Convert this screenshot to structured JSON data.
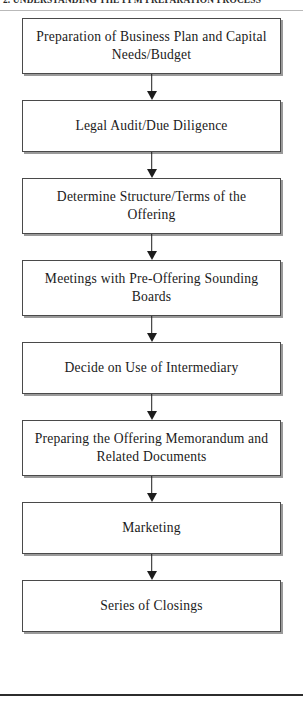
{
  "header": {
    "running_head": "2. UNDERSTANDING THE PPM PREPARATION PROCESS"
  },
  "chart_data": {
    "type": "diagram",
    "diagram_type": "flowchart",
    "orientation": "vertical",
    "title": "",
    "node_shape": "rectangle",
    "connector": "arrow-down",
    "node_count": 8,
    "nodes": [
      {
        "id": 1,
        "label": "Preparation of Business Plan and Capital Needs/Budget",
        "lines": 2
      },
      {
        "id": 2,
        "label": "Legal Audit/Due Diligence",
        "lines": 1
      },
      {
        "id": 3,
        "label": "Determine Structure/Terms of the Offering",
        "lines": 2
      },
      {
        "id": 4,
        "label": "Meetings with Pre-Offering Sounding Boards",
        "lines": 2
      },
      {
        "id": 5,
        "label": "Decide on Use of Intermediary",
        "lines": 1
      },
      {
        "id": 6,
        "label": "Preparing the Offering Memorandum and Related Documents",
        "lines": 2
      },
      {
        "id": 7,
        "label": "Marketing",
        "lines": 1
      },
      {
        "id": 8,
        "label": "Series of Closings",
        "lines": 1
      }
    ],
    "edges": [
      {
        "from": 1,
        "to": 2
      },
      {
        "from": 2,
        "to": 3
      },
      {
        "from": 3,
        "to": 4
      },
      {
        "from": 4,
        "to": 5
      },
      {
        "from": 5,
        "to": 6
      },
      {
        "from": 6,
        "to": 7
      },
      {
        "from": 7,
        "to": 8
      }
    ],
    "colors": {
      "node_border": "#4a4a4a",
      "node_fill": "#ffffff",
      "node_shadow": "#9a9a9a",
      "arrow": "#1d1d1d",
      "text": "#1a1a1a",
      "header_rule": "#b9b9b9",
      "footer_rule": "#2c2c2c"
    }
  }
}
